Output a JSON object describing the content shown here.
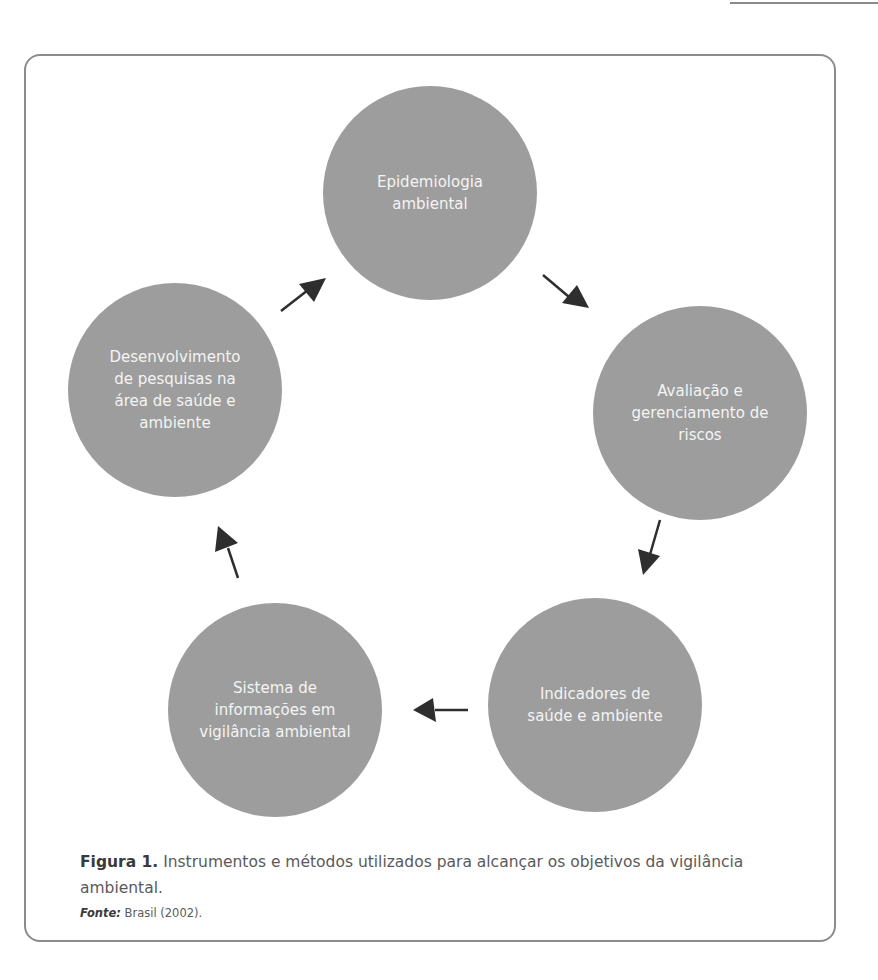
{
  "diagram": {
    "type": "cycle",
    "node_color": "#9d9d9d",
    "arrow_color": "#2e2e2e",
    "nodes": [
      {
        "id": "epidemiologia",
        "label": "Epidemiologia\nambiental"
      },
      {
        "id": "avaliacao",
        "label": "Avaliação e\ngerenciamento de\nriscos"
      },
      {
        "id": "indicadores",
        "label": "Indicadores de\nsaúde e ambiente"
      },
      {
        "id": "sistema",
        "label": "Sistema de\ninformações em\nvigilância ambiental"
      },
      {
        "id": "desenvolvimento",
        "label": "Desenvolvimento\nde pesquisas na\nárea de saúde e\nambiente"
      }
    ],
    "edges": [
      {
        "from": "epidemiologia",
        "to": "avaliacao"
      },
      {
        "from": "avaliacao",
        "to": "indicadores"
      },
      {
        "from": "indicadores",
        "to": "sistema"
      },
      {
        "from": "sistema",
        "to": "desenvolvimento"
      },
      {
        "from": "desenvolvimento",
        "to": "epidemiologia"
      }
    ]
  },
  "caption": {
    "label": "Figura 1.",
    "text": " Instrumentos e métodos utilizados para alcançar os objetivos da vigilância ambiental."
  },
  "source": {
    "label": "Fonte:",
    "text": " Brasil (2002)."
  }
}
